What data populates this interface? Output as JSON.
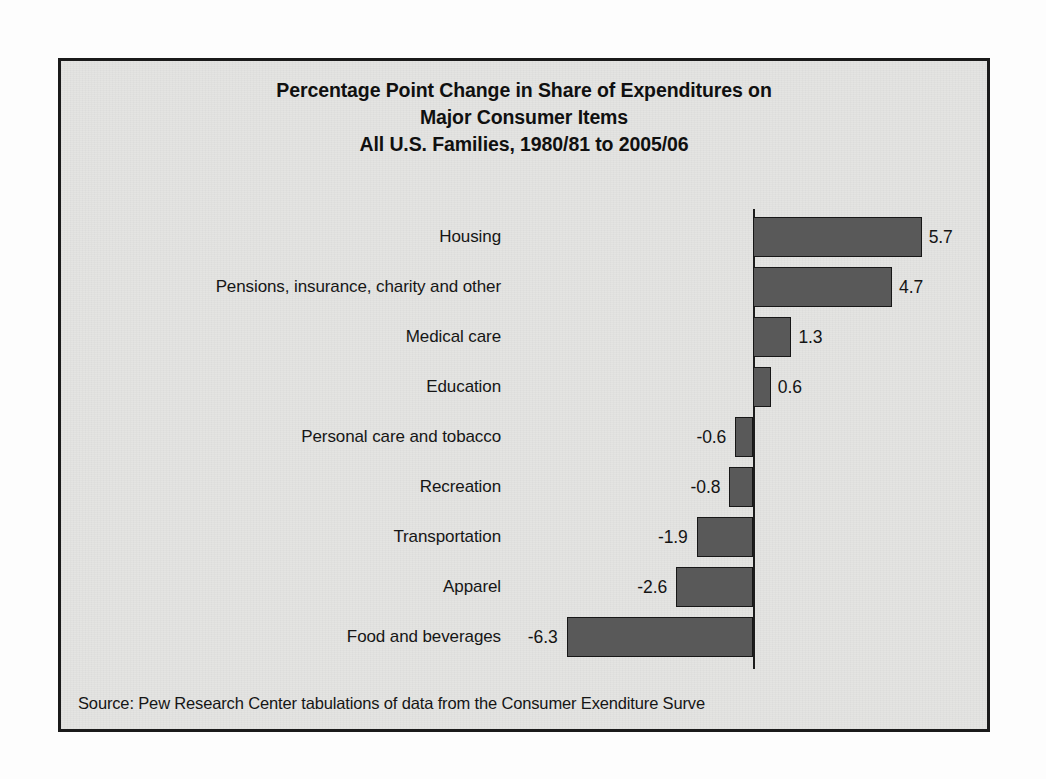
{
  "panel": {
    "background_color": "#e4e4e2",
    "border_color": "#1b1b1b"
  },
  "title": {
    "line1": "Percentage Point Change in Share of Expenditures on",
    "line2": "Major Consumer Items",
    "line3": "All U.S. Families, 1980/81 to 2005/06"
  },
  "source": {
    "text": "Source: Pew Research Center tabulations of data from the Consumer Exenditure Surve"
  },
  "chart_data": {
    "type": "bar",
    "orientation": "horizontal",
    "title": "Percentage Point Change in Share of Expenditures on Major Consumer Items\nAll U.S. Families, 1980/81 to 2005/06",
    "xlabel": "",
    "ylabel": "",
    "xlim": [
      -7,
      7
    ],
    "grid": false,
    "legend": false,
    "axis_zero_line": true,
    "bar_color": "#595959",
    "bar_border_color": "#171717",
    "units": "percentage points",
    "categories": [
      "Housing",
      "Pensions, insurance, charity and other",
      "Medical care",
      "Education",
      "Personal care and tobacco",
      "Recreation",
      "Transportation",
      "Apparel",
      "Food and beverages"
    ],
    "values": [
      5.7,
      4.7,
      1.3,
      0.6,
      -0.6,
      -0.8,
      -1.9,
      -2.6,
      -6.3
    ],
    "value_labels": [
      "5.7",
      "4.7",
      "1.3",
      "0.6",
      "-0.6",
      "-0.8",
      "-1.9",
      "-2.6",
      "-6.3"
    ]
  }
}
